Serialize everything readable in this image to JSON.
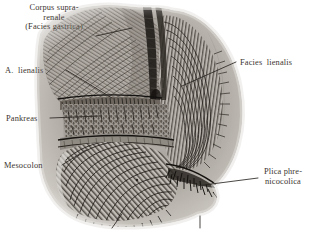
{
  "figure": {
    "type": "anatomical-illustration",
    "style": "monochrome engraving / halftone",
    "background_color": "#ffffff",
    "ink_color": "#3b3530",
    "leader_line_color": "#2b2622"
  },
  "labels": {
    "corpus_suprarenale": {
      "lines": [
        "Corpus supra-",
        "renale",
        "(Facies gastrica)"
      ],
      "text": "Corpus supra-\nrenale\n(Facies gastrica)"
    },
    "a_lienalis": {
      "text": "A.  lienalis"
    },
    "pankreas": {
      "text": "Pankreas"
    },
    "mesocolon": {
      "text": "Mesocolon"
    },
    "facies_lienalis": {
      "text": "Facies  lienalis"
    },
    "plica_phrenicocolica": {
      "lines": [
        "Plica phre-",
        "nicocolica"
      ],
      "text": "Plica phre-\nnicocolica"
    },
    "bottom_caption": {
      "text": "Colon  transversum    Flexura  coli  sinistra",
      "note": "clipped by image edge"
    }
  }
}
